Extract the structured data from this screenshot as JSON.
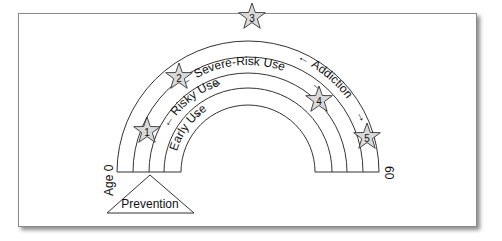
{
  "diagram": {
    "type": "rainbow-stage-diagram",
    "stages": [
      {
        "id": 1,
        "label": "Early Use"
      },
      {
        "id": 2,
        "label": "Risky Use"
      },
      {
        "id": 3,
        "label": "Severe-Risk Use"
      },
      {
        "id": 4,
        "label": "Addiction"
      }
    ],
    "stars": [
      {
        "label": "1"
      },
      {
        "label": "2"
      },
      {
        "label": "3"
      },
      {
        "label": "4"
      },
      {
        "label": "5"
      }
    ],
    "axis": {
      "start_label": "Age 0",
      "end_label": "60"
    },
    "base": {
      "label": "Prevention"
    },
    "colors": {
      "line": "#333333",
      "star_fill": "#d9d9d9",
      "background": "#ffffff"
    }
  }
}
